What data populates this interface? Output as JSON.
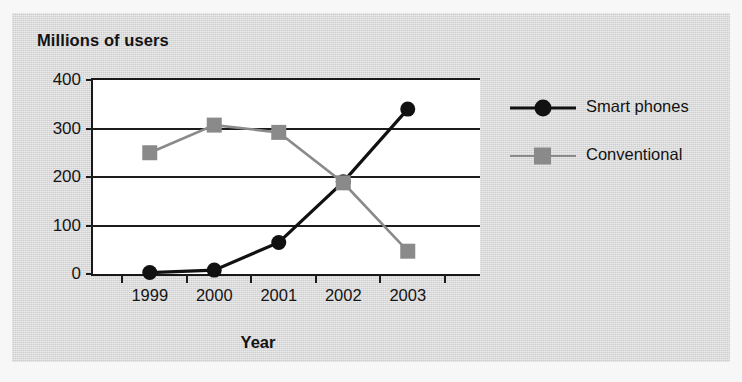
{
  "chart_data": {
    "type": "line",
    "title": "Millions of users",
    "xlabel": "Year",
    "ylabel": "",
    "categories": [
      "1999",
      "2000",
      "2001",
      "2002",
      "2003"
    ],
    "x": [
      1999,
      2000,
      2001,
      2002,
      2003
    ],
    "series": [
      {
        "name": "Smart phones",
        "marker": "circle",
        "color": "#111111",
        "values": [
          3,
          8,
          65,
          190,
          340
        ]
      },
      {
        "name": "Conventional",
        "marker": "square",
        "color": "#8a8a8a",
        "values": [
          250,
          307,
          292,
          188,
          47
        ]
      }
    ],
    "ylim": [
      0,
      400
    ],
    "yticks": [
      0,
      100,
      200,
      300,
      400
    ],
    "ytick_labels": [
      "0",
      "100",
      "200",
      "300",
      "400"
    ],
    "grid": true,
    "grid_axis": "y",
    "legend_position": "right",
    "legend": [
      "Smart phones",
      "Conventional"
    ]
  },
  "colors": {
    "panel_background": "#d8d8d8",
    "plot_background": "#ffffff",
    "axis": "#181818",
    "gridline": "#1c1c1c",
    "smart_phones": "#111111",
    "conventional": "#8a8a8a",
    "text": "#131313"
  }
}
